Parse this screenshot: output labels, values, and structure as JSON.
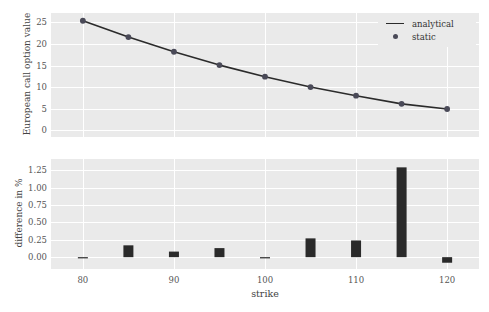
{
  "chart_data": [
    {
      "type": "line",
      "panel": "top",
      "title": "",
      "xlabel": "",
      "ylabel": "European call option value",
      "x": [
        80,
        85,
        90,
        95,
        100,
        105,
        110,
        115,
        120
      ],
      "series": [
        {
          "name": "analytical",
          "style": "line",
          "values": [
            25.4,
            21.6,
            18.2,
            15.1,
            12.4,
            10.0,
            8.0,
            6.1,
            4.9
          ]
        },
        {
          "name": "static",
          "style": "marker",
          "values": [
            25.4,
            21.6,
            18.2,
            15.1,
            12.4,
            10.0,
            8.0,
            6.1,
            4.9
          ]
        }
      ],
      "yticks": [
        0,
        5,
        10,
        15,
        20,
        25
      ],
      "ytick_labels": [
        "0",
        "5",
        "10",
        "15",
        "20",
        "25"
      ],
      "xticks": [
        80,
        90,
        100,
        110,
        120
      ],
      "xtick_labels": [
        "",
        "",
        "",
        "",
        ""
      ],
      "xlim": [
        76.5,
        123.5
      ],
      "ylim": [
        -1.6,
        27.2
      ],
      "grid": true,
      "legend_position": "upper right"
    },
    {
      "type": "bar",
      "panel": "bottom",
      "title": "",
      "xlabel": "strike",
      "ylabel": "difference in %",
      "categories": [
        80,
        85,
        90,
        95,
        100,
        105,
        110,
        115,
        120
      ],
      "values": [
        0.0,
        0.17,
        0.08,
        0.13,
        0.0,
        0.27,
        0.24,
        1.29,
        -0.08
      ],
      "yticks": [
        0.0,
        0.25,
        0.5,
        0.75,
        1.0,
        1.25
      ],
      "ytick_labels": [
        "0.00",
        "0.25",
        "0.50",
        "0.75",
        "1.00",
        "1.25"
      ],
      "xticks": [
        80,
        90,
        100,
        110,
        120
      ],
      "xtick_labels": [
        "80",
        "90",
        "100",
        "110",
        "120"
      ],
      "xlim": [
        76.5,
        123.5
      ],
      "ylim": [
        -0.17,
        1.41
      ],
      "grid": true,
      "legend_position": "none"
    }
  ],
  "legend": {
    "entries": [
      {
        "label": "analytical",
        "key": "line-key-icon",
        "color": "#2b2b2b"
      },
      {
        "label": "static",
        "key": "dot-key-icon",
        "color": "#4a4a58"
      }
    ]
  },
  "style": {
    "panel_background": "#eaeaea",
    "gridline_color": "#ffffff",
    "line_color": "#2b2b2b",
    "marker_color": "#4a4a58",
    "bar_color": "#2a2a2a",
    "tick_label_color": "#555555",
    "axis_label_color": "#444444",
    "figure_background": "#ffffff"
  }
}
